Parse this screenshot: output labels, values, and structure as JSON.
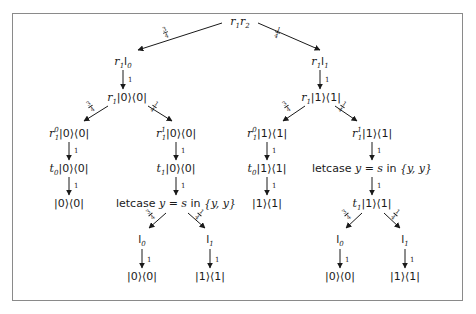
{
  "diagram": {
    "type": "probability-tree",
    "root": "r1 r2",
    "colors": {
      "line": "#1a1a1a",
      "frame": "#8a8a8a",
      "background": "#ffffff"
    },
    "edge_labels": {
      "root_left": {
        "num": "3",
        "den": "4"
      },
      "root_right": {
        "num": "1",
        "den": "4"
      },
      "one": "1",
      "split_left": {
        "num": "3",
        "den": "4"
      },
      "split_right": {
        "num": "1",
        "den": "4"
      }
    },
    "nodes": {
      "root": {
        "a": "r",
        "a_sub": "1",
        "b": "r",
        "b_sub": "2"
      },
      "l_level1": {
        "a": "r",
        "a_sub": "1",
        "b": "l",
        "b_sub": "0"
      },
      "r_level1": {
        "a": "r",
        "a_sub": "1",
        "b": "l",
        "b_sub": "1"
      },
      "l_level2": {
        "a": "r",
        "a_sub": "1",
        "ket": "|0⟩⟨0|"
      },
      "r_level2": {
        "a": "r",
        "a_sub": "1",
        "ket": "|1⟩⟨1|"
      },
      "ll_level3": {
        "a": "r",
        "a_sub": "1",
        "a_sup": "0",
        "ket": "|0⟩⟨0|"
      },
      "lr_level3": {
        "a": "r",
        "a_sub": "1",
        "a_sup": "1",
        "ket": "|0⟩⟨0|"
      },
      "rl_level3": {
        "a": "r",
        "a_sub": "1",
        "a_sup": "0",
        "ket": "|1⟩⟨1|"
      },
      "rr_level3": {
        "a": "r",
        "a_sub": "1",
        "a_sup": "1",
        "ket": "|1⟩⟨1|"
      },
      "ll_level4": {
        "a": "t",
        "a_sub": "0",
        "ket": "|0⟩⟨0|"
      },
      "lr_level4": {
        "a": "t",
        "a_sub": "1",
        "ket": "|0⟩⟨0|"
      },
      "rl_level4": {
        "a": "t",
        "a_sub": "0",
        "ket": "|1⟩⟨1|"
      },
      "rr_level4": {
        "kw1": "letcase",
        "var": "y",
        "eq": " = ",
        "val": "s",
        "kw2": " in ",
        "set": "{y, y}"
      },
      "ll_level5": {
        "ket": "|0⟩⟨0|"
      },
      "lr_level5": {
        "kw1": "letcase",
        "var": "y",
        "eq": " = ",
        "val": "s",
        "kw2": " in ",
        "set": "{y, y}"
      },
      "rl_level5": {
        "ket": "|1⟩⟨1|"
      },
      "rr_level5": {
        "a": "t",
        "a_sub": "1",
        "ket": "|1⟩⟨1|"
      },
      "lr_leaf_l": {
        "a": "l",
        "a_sub": "0"
      },
      "lr_leaf_r": {
        "a": "l",
        "a_sub": "1"
      },
      "lr_final_l": {
        "ket": "|0⟩⟨0|"
      },
      "lr_final_r": {
        "ket": "|1⟩⟨1|"
      },
      "rr_leaf_l": {
        "a": "l",
        "a_sub": "0"
      },
      "rr_leaf_r": {
        "a": "l",
        "a_sub": "1"
      },
      "rr_final_l": {
        "ket": "|0⟩⟨0|"
      },
      "rr_final_r": {
        "ket": "|1⟩⟨1|"
      }
    }
  }
}
